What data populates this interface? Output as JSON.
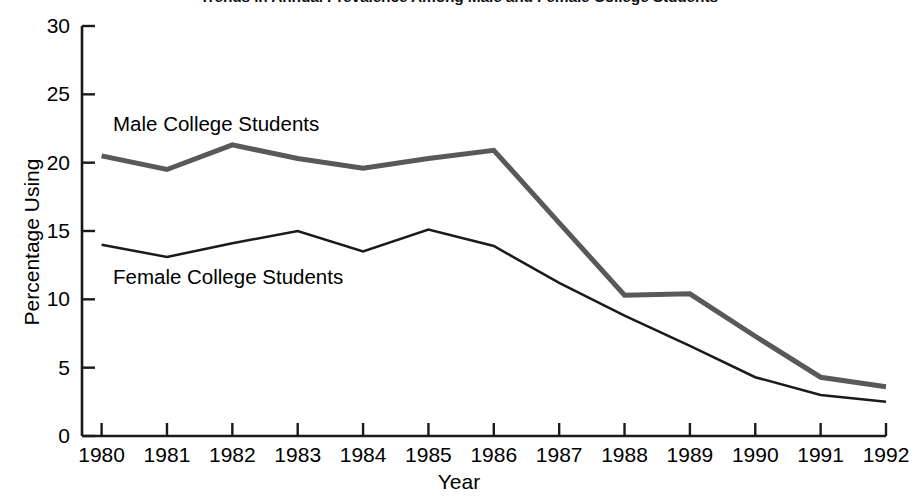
{
  "chart_data": {
    "type": "line",
    "title": "Trends in Annual Prevalence Among Male and Female College Students",
    "xlabel": "Year",
    "ylabel": "Percentage Using",
    "x": [
      1980,
      1981,
      1982,
      1983,
      1984,
      1985,
      1986,
      1987,
      1988,
      1989,
      1990,
      1991,
      1992
    ],
    "categories": [
      "1980",
      "1981",
      "1982",
      "1983",
      "1984",
      "1985",
      "1986",
      "1987",
      "1988",
      "1989",
      "1990",
      "1991",
      "1992"
    ],
    "xlim": [
      1979.7,
      1992.0
    ],
    "ylim": [
      0,
      30
    ],
    "yticks": [
      0,
      5,
      10,
      15,
      20,
      25,
      30
    ],
    "ytick_labels": [
      "0",
      "5",
      "10",
      "15",
      "20",
      "25",
      "30"
    ],
    "grid": false,
    "legend": "inline-annotations",
    "series": [
      {
        "name": "Male College Students",
        "color": "#595959",
        "line_width": 5,
        "values": [
          20.5,
          19.5,
          21.3,
          20.3,
          19.6,
          20.3,
          20.9,
          15.6,
          10.3,
          10.4,
          7.3,
          4.3,
          3.6
        ]
      },
      {
        "name": "Female College Students",
        "color": "#1a1a1a",
        "line_width": 2.5,
        "values": [
          14.0,
          13.1,
          14.1,
          15.0,
          13.5,
          15.1,
          13.9,
          11.2,
          8.8,
          6.6,
          4.3,
          3.0,
          2.5
        ]
      }
    ],
    "annotations": [
      {
        "text": "Male College Students",
        "series": "Male College Students"
      },
      {
        "text": "Female College Students",
        "series": "Female College Students"
      }
    ]
  },
  "axes": {
    "y_axis_label": "Percentage Using",
    "x_axis_label": "Year"
  }
}
